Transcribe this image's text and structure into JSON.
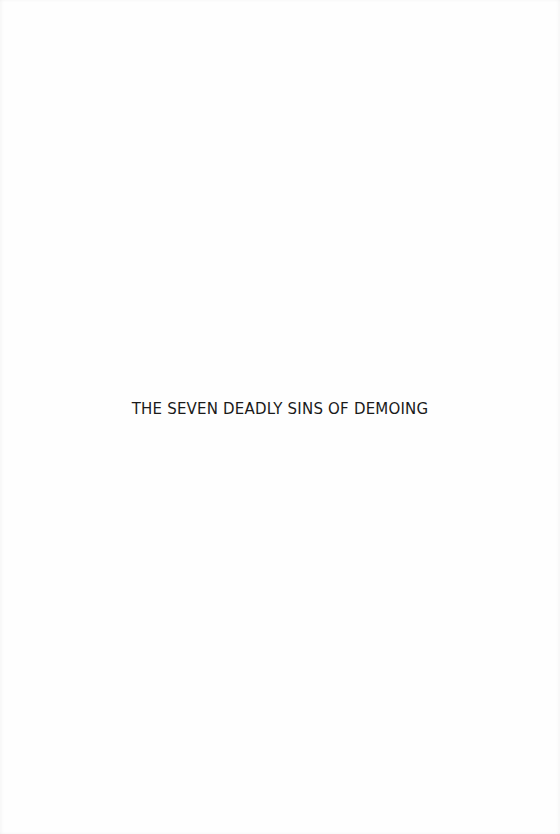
{
  "document": {
    "title": "THE SEVEN DEADLY SINS OF DEMOING"
  }
}
